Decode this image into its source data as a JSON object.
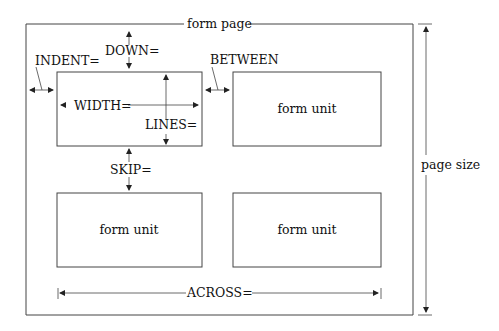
{
  "diagram": {
    "title": "form page",
    "colors": {
      "line": "#444444",
      "text": "#111111",
      "background": "#ffffff"
    },
    "outer_page": {
      "label": "form page",
      "x": 26,
      "y": 24,
      "w": 387,
      "h": 291
    },
    "units": [
      {
        "label": "form unit",
        "x": 57,
        "y": 72,
        "w": 145,
        "h": 74,
        "has_label": false
      },
      {
        "label": "form unit",
        "x": 233,
        "y": 72,
        "w": 148,
        "h": 74,
        "has_label": true
      },
      {
        "label": "form unit",
        "x": 57,
        "y": 193,
        "w": 145,
        "h": 74,
        "has_label": true
      },
      {
        "label": "form unit",
        "x": 233,
        "y": 193,
        "w": 148,
        "h": 74,
        "has_label": true
      }
    ],
    "dimensions": {
      "indent": "INDENT=",
      "down": "DOWN=",
      "between": "BETWEEN",
      "width": "WIDTH=",
      "lines": "LINES=",
      "skip": "SKIP=",
      "across": "ACROSS=",
      "page_size": "page size"
    },
    "unit_labels": {
      "top_right": "form unit",
      "bottom_left": "form unit",
      "bottom_right": "form unit"
    }
  }
}
